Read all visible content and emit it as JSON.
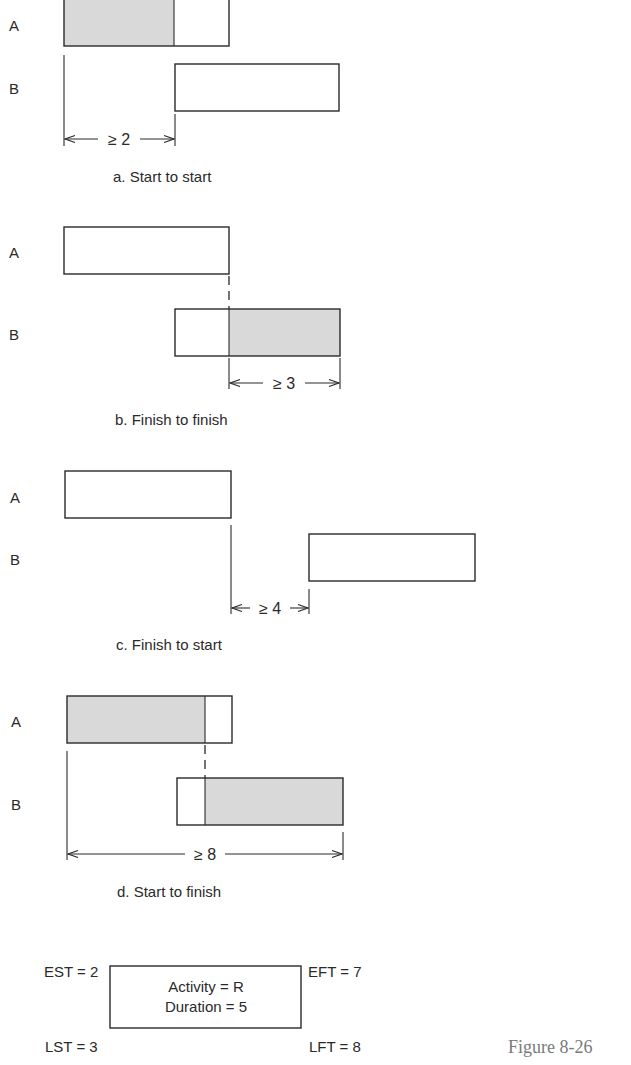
{
  "row_labels": {
    "a": "A",
    "b": "B"
  },
  "panels": [
    {
      "id": "a",
      "caption": "a. Start to start",
      "relationship": "start-to-start",
      "lag_label": "≥ 2",
      "lag": 2
    },
    {
      "id": "b",
      "caption": "b. Finish to finish",
      "relationship": "finish-to-finish",
      "lag_label": "≥ 3",
      "lag": 3
    },
    {
      "id": "c",
      "caption": "c. Finish to start",
      "relationship": "finish-to-start",
      "lag_label": "≥ 4",
      "lag": 4
    },
    {
      "id": "d",
      "caption": "d. Start to finish",
      "relationship": "start-to-finish",
      "lag_label": "≥ 8",
      "lag": 8
    }
  ],
  "node": {
    "activity": "Activity = R",
    "duration": "Duration = 5",
    "est": "EST = 2",
    "eft": "EFT = 7",
    "lst": "LST = 3",
    "lft": "LFT = 8"
  },
  "figure_label": "Figure 8-26",
  "colors": {
    "shade": "#d9d9d9",
    "line": "#2a2a2a",
    "figure_label": "#7a7a7a"
  }
}
